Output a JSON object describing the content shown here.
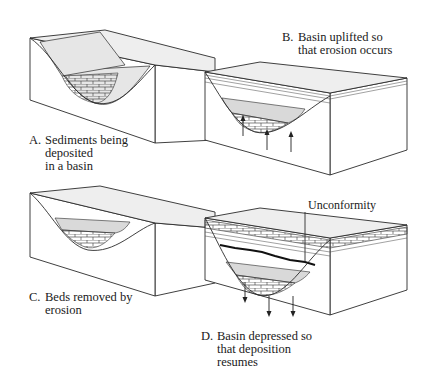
{
  "figure": {
    "panels": [
      {
        "id": "A",
        "letter": "A.",
        "caption_lines": [
          "Sediments being",
          "deposited",
          "in a basin"
        ]
      },
      {
        "id": "B",
        "letter": "B.",
        "caption_lines": [
          "Basin uplifted so",
          "that erosion occurs"
        ]
      },
      {
        "id": "C",
        "letter": "C.",
        "caption_lines": [
          "Beds removed by",
          "erosion"
        ]
      },
      {
        "id": "D",
        "letter": "D.",
        "caption_lines": [
          "Basin depressed so",
          "that deposition",
          "resumes"
        ]
      }
    ],
    "annotation": {
      "unconformity_label": "Unconformity"
    },
    "arrows": {
      "B": "up",
      "D": "down"
    }
  }
}
